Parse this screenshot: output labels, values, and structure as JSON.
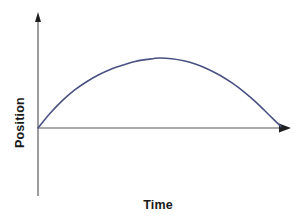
{
  "figure": {
    "background_color": "#ffffff",
    "width": 297,
    "height": 218
  },
  "labels": {
    "xlabel": "Time",
    "ylabel": "Position"
  },
  "style": {
    "curve_color": "#4a5183",
    "axis_color": "#8c8c8c",
    "arrow_color": "#1f1f1f",
    "label_color": "#1a1a1a",
    "curve_width": 1.6,
    "axis_width": 1.6
  },
  "chart_data": {
    "type": "line",
    "title": "",
    "subtitle": "",
    "xlabel": "Time",
    "ylabel": "Position",
    "grid": false,
    "legend": false,
    "legend_position": "none",
    "xticks": [],
    "yticks": [],
    "xtick_labels": [],
    "ytick_labels": [],
    "xlim": [
      0,
      1
    ],
    "ylim": [
      0,
      1
    ],
    "annotations": [],
    "series": [
      {
        "name": "Position vs Time",
        "color": "#4a5183",
        "x": [
          0.0,
          0.05,
          0.1,
          0.15,
          0.2,
          0.25,
          0.3,
          0.35,
          0.4,
          0.45,
          0.5,
          0.55,
          0.6,
          0.65,
          0.7,
          0.75,
          0.8,
          0.85,
          0.9,
          0.95,
          1.0
        ],
        "y": [
          0.0,
          0.21,
          0.39,
          0.54,
          0.66,
          0.76,
          0.84,
          0.9,
          0.95,
          0.98,
          1.0,
          0.99,
          0.96,
          0.91,
          0.84,
          0.75,
          0.64,
          0.51,
          0.36,
          0.19,
          0.02
        ]
      }
    ]
  },
  "geometry": {
    "origin": {
      "x": 38,
      "y": 128
    },
    "y_axis_top": {
      "x": 38,
      "y": 14
    },
    "y_axis_bottom": {
      "x": 38,
      "y": 196
    },
    "x_axis_right": {
      "x": 288,
      "y": 128
    },
    "curve_peak": {
      "x": 147,
      "y": 58
    },
    "curve_end": {
      "x": 281,
      "y": 126
    }
  }
}
